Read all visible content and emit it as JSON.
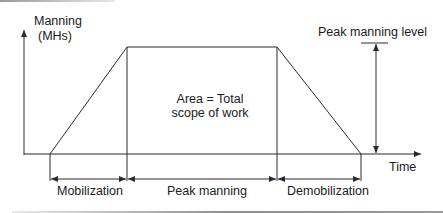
{
  "figure": {
    "y_axis_label_line1": "Manning",
    "y_axis_label_line2": "(MHs)",
    "x_axis_label": "Time",
    "area_label_line1": "Area = Total",
    "area_label_line2": "scope of work",
    "peak_level_label": "Peak manning level",
    "phases": [
      {
        "label": "Mobilization"
      },
      {
        "label": "Peak manning"
      },
      {
        "label": "Demobilization"
      }
    ]
  },
  "colors": {
    "line": "#2a2a2a",
    "text": "#1a1a1a",
    "background": "#ffffff"
  }
}
